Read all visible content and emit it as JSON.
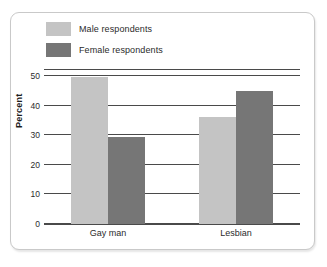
{
  "chart_data": {
    "type": "bar",
    "title": "",
    "xlabel": "",
    "ylabel": "Percent",
    "ylim": [
      0,
      50
    ],
    "yticks": [
      0,
      10,
      20,
      30,
      40,
      50
    ],
    "ytick_labels": [
      "0",
      "10",
      "20",
      "30",
      "40",
      "50"
    ],
    "grid": true,
    "legend_position": "top-left",
    "categories": [
      "Gay man",
      "Lesbian"
    ],
    "series": [
      {
        "name": "Male respondents",
        "color": "#c4c4c4",
        "values": [
          49.5,
          36
        ]
      },
      {
        "name": "Female respondents",
        "color": "#767676",
        "values": [
          29.5,
          45
        ]
      }
    ]
  },
  "figure": {
    "border_color": "#c9c9c9",
    "background": "#ffffff",
    "axis_color": "#4a4a4a"
  }
}
